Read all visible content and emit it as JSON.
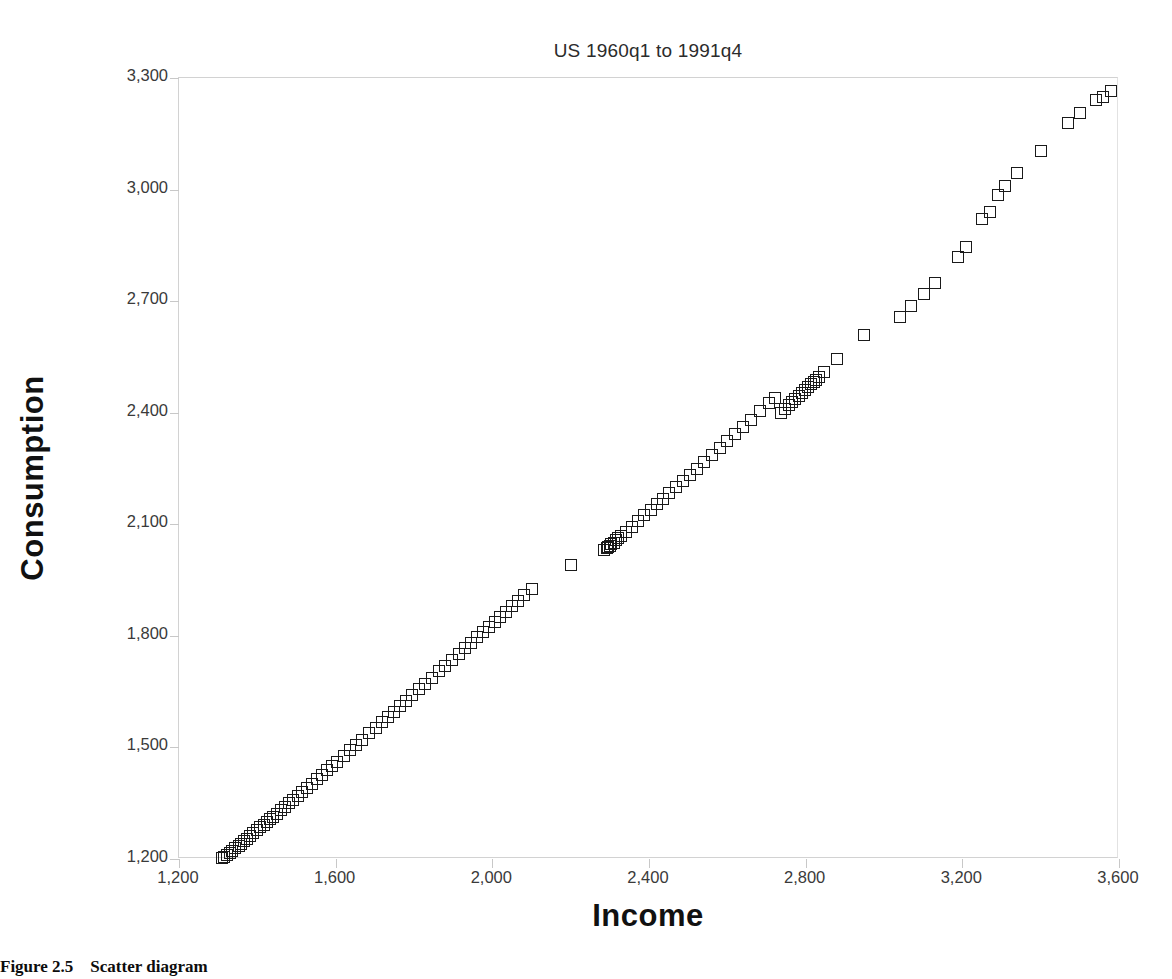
{
  "figure": {
    "caption_number": "Figure 2.5",
    "caption_text": "Scatter diagram"
  },
  "chart_data": {
    "type": "scatter",
    "title": "US 1960q1 to 1991q4",
    "xlabel": "Income",
    "ylabel": "Consumption",
    "xlim": [
      1200,
      3600
    ],
    "ylim": [
      1200,
      3300
    ],
    "xticks": [
      "1,200",
      "1,600",
      "2,000",
      "2,400",
      "2,800",
      "3,200",
      "3,600"
    ],
    "xtick_values": [
      1200,
      1600,
      2000,
      2400,
      2800,
      3200,
      3600
    ],
    "yticks": [
      "1,200",
      "1,500",
      "1,800",
      "2,100",
      "2,400",
      "2,700",
      "3,000",
      "3,300"
    ],
    "ytick_values": [
      1200,
      1500,
      1800,
      2100,
      2400,
      2700,
      3000,
      3300
    ],
    "grid": false,
    "legend": "none",
    "marker": "open-square",
    "marker_color": "#1a1a1a",
    "n_points": 128,
    "series": [
      {
        "name": "US quarterly consumption vs income",
        "x": [
          1310,
          1316,
          1322,
          1330,
          1336,
          1344,
          1352,
          1358,
          1366,
          1374,
          1382,
          1390,
          1399,
          1408,
          1416,
          1424,
          1433,
          1441,
          1450,
          1460,
          1470,
          1482,
          1492,
          1503,
          1515,
          1528,
          1540,
          1552,
          1565,
          1578,
          1590,
          1604,
          1620,
          1636,
          1652,
          1668,
          1686,
          1702,
          1718,
          1733,
          1748,
          1764,
          1780,
          1796,
          1812,
          1828,
          1846,
          1864,
          1880,
          1896,
          1914,
          1930,
          1946,
          1962,
          1976,
          1992,
          2006,
          2020,
          2034,
          2050,
          2066,
          2082,
          2100,
          2200,
          2286,
          2292,
          2296,
          2300,
          2304,
          2310,
          2316,
          2322,
          2328,
          2340,
          2356,
          2372,
          2388,
          2404,
          2420,
          2436,
          2452,
          2468,
          2486,
          2504,
          2522,
          2540,
          2560,
          2580,
          2600,
          2620,
          2640,
          2660,
          2684,
          2706,
          2722,
          2736,
          2748,
          2758,
          2766,
          2774,
          2782,
          2790,
          2798,
          2806,
          2814,
          2820,
          2826,
          2834,
          2848,
          2880,
          2950,
          3040,
          3070,
          3102,
          3130,
          3190,
          3210,
          3250,
          3270,
          3290,
          3310,
          3340,
          3400,
          3470,
          3500,
          3540,
          3560,
          3580
        ],
        "y": [
          1202,
          1206,
          1211,
          1216,
          1222,
          1229,
          1235,
          1241,
          1248,
          1255,
          1262,
          1269,
          1277,
          1285,
          1292,
          1299,
          1307,
          1314,
          1322,
          1331,
          1340,
          1350,
          1359,
          1369,
          1380,
          1392,
          1403,
          1414,
          1426,
          1438,
          1449,
          1462,
          1477,
          1492,
          1507,
          1521,
          1538,
          1553,
          1568,
          1582,
          1596,
          1611,
          1626,
          1641,
          1656,
          1671,
          1688,
          1705,
          1720,
          1735,
          1752,
          1767,
          1782,
          1797,
          1810,
          1825,
          1838,
          1851,
          1864,
          1879,
          1894,
          1909,
          1926,
          1990,
          2030,
          2035,
          2038,
          2042,
          2046,
          2051,
          2057,
          2062,
          2068,
          2079,
          2094,
          2109,
          2124,
          2139,
          2154,
          2169,
          2184,
          2199,
          2216,
          2233,
          2250,
          2267,
          2286,
          2305,
          2324,
          2343,
          2362,
          2381,
          2404,
          2425,
          2440,
          2398,
          2410,
          2420,
          2428,
          2436,
          2444,
          2452,
          2460,
          2468,
          2476,
          2482,
          2488,
          2496,
          2510,
          2545,
          2608,
          2658,
          2688,
          2720,
          2750,
          2820,
          2845,
          2920,
          2940,
          2985,
          3010,
          3045,
          3105,
          3180,
          3205,
          3240,
          3250,
          3265
        ]
      }
    ]
  }
}
